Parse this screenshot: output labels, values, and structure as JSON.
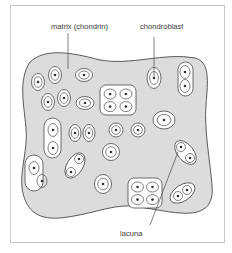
{
  "figure": {
    "labels": {
      "matrix": "matrix (chondrin)",
      "chondroblast": "chondroblast",
      "lacuna": "lacuna"
    }
  },
  "colors": {
    "matrix_fill": "#dcdcdc",
    "outline": "#4a4a4a",
    "lacuna_fill": "#ffffff",
    "nucleus": "#333333",
    "frame": "#c8c8c8"
  },
  "cells": {
    "single": [
      {
        "cx": 38,
        "cy": 82,
        "rx": 6.5,
        "ry": 8.5
      },
      {
        "cx": 55,
        "cy": 75,
        "rx": 6.5,
        "ry": 8.5
      },
      {
        "cx": 84,
        "cy": 75,
        "rx": 8.5,
        "ry": 6.5
      },
      {
        "cx": 48,
        "cy": 102,
        "rx": 6.5,
        "ry": 8.5
      },
      {
        "cx": 64,
        "cy": 98,
        "rx": 6.5,
        "ry": 8.5
      },
      {
        "cx": 85,
        "cy": 103,
        "rx": 9,
        "ry": 6.5
      },
      {
        "cx": 154,
        "cy": 78,
        "rx": 7,
        "ry": 10.5
      },
      {
        "cx": 164,
        "cy": 120,
        "rx": 11,
        "ry": 9
      },
      {
        "cx": 116,
        "cy": 130,
        "rx": 7,
        "ry": 7
      },
      {
        "cx": 138,
        "cy": 130,
        "rx": 7,
        "ry": 7
      },
      {
        "cx": 111,
        "cy": 152,
        "rx": 8.5,
        "ry": 8.5
      },
      {
        "cx": 103,
        "cy": 184,
        "rx": 8.5,
        "ry": 9.5
      }
    ],
    "pairs_vertical": [
      {
        "x": 44,
        "y": 118,
        "w": 17,
        "h": 40,
        "n": [
          [
            53,
            130
          ],
          [
            53,
            148
          ]
        ]
      },
      {
        "x": 25,
        "y": 155,
        "w": 18,
        "h": 36,
        "n": [
          [
            34,
            168
          ],
          [
            42,
            181
          ]
        ]
      },
      {
        "x": 178,
        "y": 62,
        "w": 15,
        "h": 34,
        "n": [
          [
            185,
            72
          ],
          [
            185,
            86
          ]
        ]
      }
    ],
    "pairs_side": [
      {
        "cx": 75,
        "cy": 133
      },
      {
        "cx": 89,
        "cy": 133
      }
    ],
    "teardrop_pairs": [
      {
        "a": [
          79,
          159
        ],
        "b": [
          71,
          172
        ]
      },
      {
        "a": [
          181,
          147
        ],
        "b": [
          190,
          158
        ]
      },
      {
        "a": [
          187,
          190
        ],
        "b": [
          178,
          196
        ]
      }
    ],
    "clusters": [
      {
        "x": 100,
        "y": 85,
        "w": 36,
        "h": 30
      },
      {
        "x": 128,
        "y": 178,
        "w": 34,
        "h": 30
      }
    ]
  }
}
